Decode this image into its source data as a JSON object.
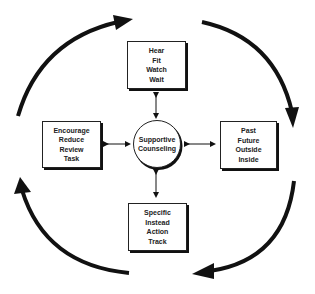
{
  "diagram": {
    "center": {
      "lines": [
        "Supportive",
        "Counseling"
      ]
    },
    "top": {
      "lines": [
        "Hear",
        "Fit",
        "Watch",
        "Wait"
      ]
    },
    "right": {
      "lines": [
        "Past",
        "Future",
        "Outside",
        "Inside"
      ]
    },
    "bottom": {
      "lines": [
        "Specific",
        "Instead",
        "Action",
        "Track"
      ]
    },
    "left": {
      "lines": [
        "Encourage",
        "Reduce",
        "Review",
        "Task"
      ]
    },
    "cycle_direction": "clockwise",
    "colors": {
      "ink": "#111111",
      "background": "#ffffff"
    }
  }
}
